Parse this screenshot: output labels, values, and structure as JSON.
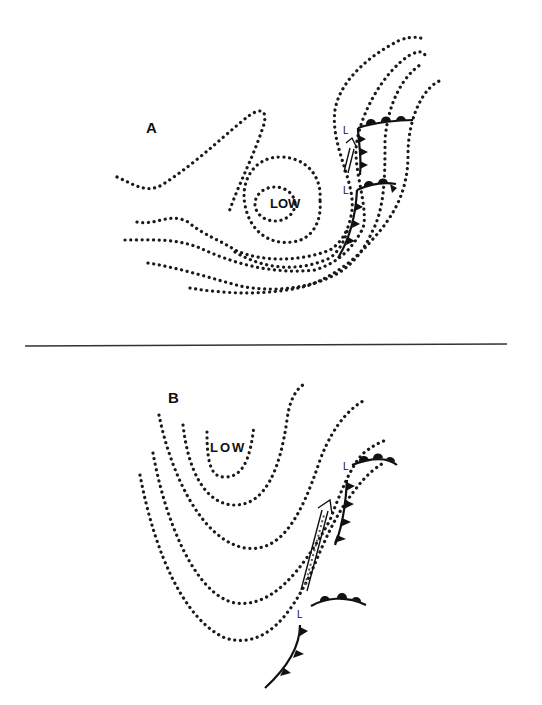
{
  "panels": [
    {
      "id": "A",
      "label": "A",
      "center_label": "LOW",
      "secondary_low_labels": [
        "L",
        "L"
      ]
    },
    {
      "id": "B",
      "label": "B",
      "center_label": "LOW",
      "secondary_low_labels": [
        "L",
        "L"
      ]
    }
  ],
  "symbols": {
    "isobars": "dotted-contour-lines",
    "cold_front": "line-with-triangles",
    "warm_front": "line-with-semicircles",
    "jet_arrow": "double-line-arrow"
  },
  "colors": {
    "ink": "#111111",
    "background": "#ffffff"
  }
}
